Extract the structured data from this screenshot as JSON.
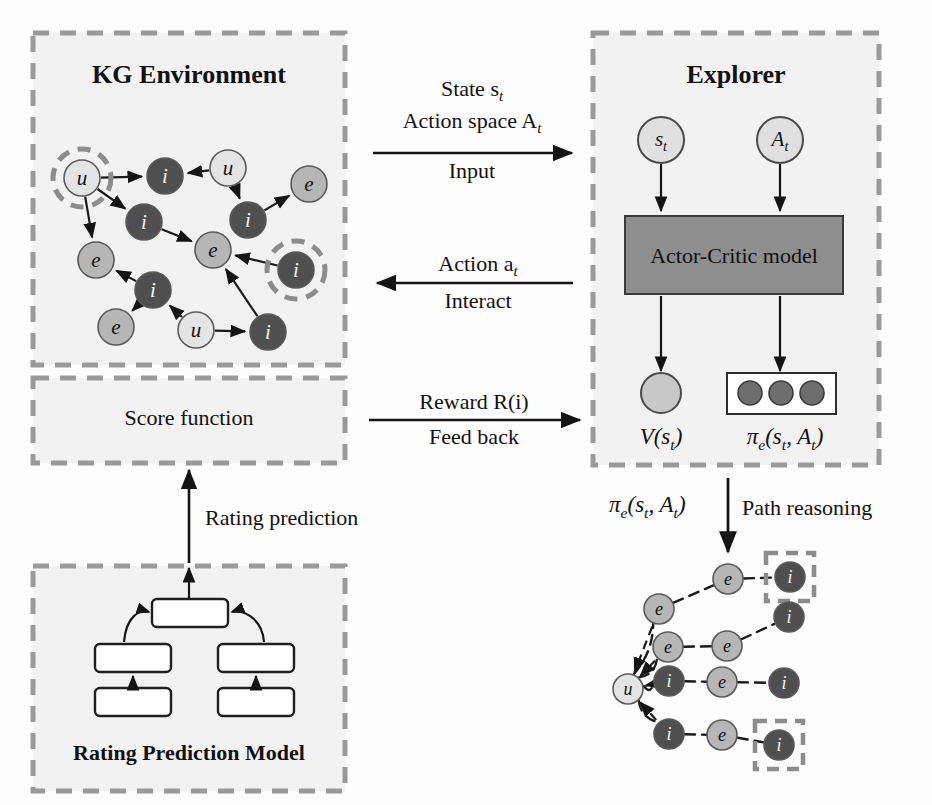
{
  "figure": {
    "type": "diagram"
  },
  "panels": {
    "kg": {
      "title": "KG Environment",
      "score_function_label": "Score function"
    },
    "explorer": {
      "title": "Explorer",
      "input_state": "s",
      "input_state_sub": "t",
      "input_action": "A",
      "input_action_sub": "t",
      "model_box_label": "Actor-Critic model",
      "value_head_label": "V(s",
      "value_head_label_sub": "t",
      "value_head_label_end": ")",
      "policy_head_pi": "π",
      "policy_head_pi_sub": "e",
      "policy_head_args": "(s",
      "policy_head_args_sub1": "t",
      "policy_head_args_mid": ", A",
      "policy_head_args_sub2": "t",
      "policy_head_args_end": ")"
    },
    "rating": {
      "title": "Rating Prediction Model"
    }
  },
  "connectors": {
    "to_explorer": {
      "line1": "State s",
      "line1_sub": "t",
      "line2": "Action space A",
      "line2_sub": "t",
      "line3": "Input"
    },
    "to_kg": {
      "line1": "Action a",
      "line1_sub": "t",
      "line2": "Interact"
    },
    "reward": {
      "line1": "Reward R(i)",
      "line2": "Feed back"
    },
    "rating_prediction": {
      "label": "Rating prediction"
    },
    "path_reasoning": {
      "policy": "π",
      "policy_sub": "e",
      "policy_args": "(s",
      "policy_args_sub1": "t",
      "policy_args_mid": ", A",
      "policy_args_sub2": "t",
      "policy_args_end": ")",
      "label": "Path reasoning"
    }
  },
  "legend": {
    "node_types": [
      {
        "key": "u",
        "name": "user-node",
        "color": "#e4e4e4"
      },
      {
        "key": "i",
        "name": "item-node",
        "color": "#4f4f4f"
      },
      {
        "key": "e",
        "name": "entity-node",
        "color": "#b6b6b6"
      }
    ]
  },
  "colors": {
    "panel_fill": "#f2f2f2",
    "panel_border": "#9a9a9a",
    "model_box_fill": "#8e8e8e",
    "model_box_border": "#3a3a3a",
    "user_node": "#e4e4e4",
    "item_node": "#4f4f4f",
    "entity_node": "#b6b6b6",
    "edge": "#1a1a1a",
    "highlight_ring": "#8c8c8c"
  },
  "kg_graph": {
    "nodes": [
      {
        "id": "n1",
        "label": "u",
        "type": "u",
        "x": 82,
        "y": 178,
        "highlight": "circle"
      },
      {
        "id": "n2",
        "label": "i",
        "type": "i",
        "x": 165,
        "y": 176
      },
      {
        "id": "n3",
        "label": "u",
        "type": "u",
        "x": 228,
        "y": 168
      },
      {
        "id": "n4",
        "label": "e",
        "type": "e",
        "x": 309,
        "y": 184
      },
      {
        "id": "n5",
        "label": "i",
        "type": "i",
        "x": 144,
        "y": 222
      },
      {
        "id": "n6",
        "label": "i",
        "type": "i",
        "x": 248,
        "y": 220
      },
      {
        "id": "n7",
        "label": "e",
        "type": "e",
        "x": 96,
        "y": 260
      },
      {
        "id": "n8",
        "label": "e",
        "type": "e",
        "x": 213,
        "y": 250
      },
      {
        "id": "n9",
        "label": "i",
        "type": "i",
        "x": 296,
        "y": 270,
        "highlight": "circle"
      },
      {
        "id": "n10",
        "label": "i",
        "type": "i",
        "x": 153,
        "y": 290
      },
      {
        "id": "n11",
        "label": "e",
        "type": "e",
        "x": 116,
        "y": 327
      },
      {
        "id": "n12",
        "label": "u",
        "type": "u",
        "x": 196,
        "y": 330
      },
      {
        "id": "n13",
        "label": "i",
        "type": "i",
        "x": 268,
        "y": 332
      }
    ],
    "edges": [
      {
        "from": "n1",
        "to": "n2"
      },
      {
        "from": "n3",
        "to": "n2"
      },
      {
        "from": "n1",
        "to": "n5"
      },
      {
        "from": "n1",
        "to": "n7"
      },
      {
        "from": "n3",
        "to": "n6"
      },
      {
        "from": "n6",
        "to": "n4"
      },
      {
        "from": "n5",
        "to": "n8"
      },
      {
        "from": "n9",
        "to": "n8"
      },
      {
        "from": "n10",
        "to": "n7"
      },
      {
        "from": "n10",
        "to": "n11"
      },
      {
        "from": "n12",
        "to": "n10"
      },
      {
        "from": "n12",
        "to": "n13"
      },
      {
        "from": "n13",
        "to": "n8"
      }
    ]
  },
  "path_graph": {
    "nodes": [
      {
        "id": "p_u",
        "label": "u",
        "type": "u",
        "x": 628,
        "y": 689
      },
      {
        "id": "p_e1",
        "label": "e",
        "type": "e",
        "x": 659,
        "y": 609
      },
      {
        "id": "p_e2",
        "label": "e",
        "type": "e",
        "x": 668,
        "y": 647
      },
      {
        "id": "p_i1",
        "label": "i",
        "type": "i",
        "x": 669,
        "y": 681
      },
      {
        "id": "p_i2",
        "label": "i",
        "type": "i",
        "x": 669,
        "y": 734
      },
      {
        "id": "p_e3",
        "label": "e",
        "type": "e",
        "x": 728,
        "y": 579
      },
      {
        "id": "p_e4",
        "label": "e",
        "type": "e",
        "x": 727,
        "y": 646
      },
      {
        "id": "p_e5",
        "label": "e",
        "type": "e",
        "x": 722,
        "y": 682
      },
      {
        "id": "p_e6",
        "label": "e",
        "type": "e",
        "x": 722,
        "y": 735
      },
      {
        "id": "p_i3",
        "label": "i",
        "type": "i",
        "x": 790,
        "y": 577,
        "highlight": "box"
      },
      {
        "id": "p_i4",
        "label": "i",
        "type": "i",
        "x": 789,
        "y": 617
      },
      {
        "id": "p_i5",
        "label": "i",
        "type": "i",
        "x": 784,
        "y": 683
      },
      {
        "id": "p_i6",
        "label": "i",
        "type": "i",
        "x": 779,
        "y": 745,
        "highlight": "box"
      }
    ],
    "paths": [
      [
        "p_u",
        "p_e1",
        "p_e3",
        "p_i3"
      ],
      [
        "p_u",
        "p_e2",
        "p_e4",
        "p_i4"
      ],
      [
        "p_u",
        "p_i1",
        "p_e5",
        "p_i5"
      ],
      [
        "p_u",
        "p_i2",
        "p_e6",
        "p_i6"
      ]
    ]
  }
}
